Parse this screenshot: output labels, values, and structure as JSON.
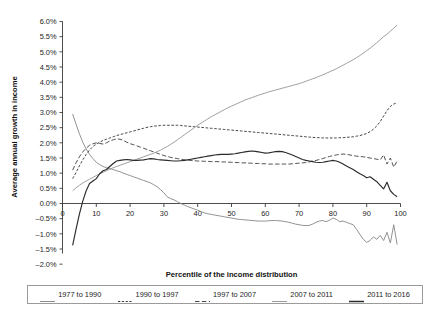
{
  "chart_data": {
    "type": "line",
    "title": "",
    "xlabel": "Percentile of the income distribution",
    "ylabel": "Average annual growth in income",
    "xlim": [
      0,
      100
    ],
    "ylim": [
      -2.0,
      6.0
    ],
    "ytick_labels": [
      "6.0%",
      "5.5%",
      "5.0%",
      "4.5%",
      "4.0%",
      "3.5%",
      "3.0%",
      "2.5%",
      "2.0%",
      "1.5%",
      "1.0%",
      "0.5%",
      "0.0%",
      "-0.5%",
      "-1.0%",
      "-1.5%",
      "-2.0%"
    ],
    "ytick_values": [
      6.0,
      5.5,
      5.0,
      4.5,
      4.0,
      3.5,
      3.0,
      2.5,
      2.0,
      1.5,
      1.0,
      0.5,
      0.0,
      -0.5,
      -1.0,
      -1.5,
      -2.0
    ],
    "xtick_labels": [
      "0",
      "10",
      "20",
      "30",
      "40",
      "50",
      "60",
      "70",
      "80",
      "90",
      "100"
    ],
    "xtick_values": [
      0,
      10,
      20,
      30,
      40,
      50,
      60,
      70,
      80,
      90,
      100
    ],
    "grid": false,
    "legend_position": "bottom",
    "x": [
      3,
      4,
      5,
      6,
      7,
      8,
      9,
      10,
      11,
      12,
      13,
      14,
      15,
      16,
      17,
      18,
      19,
      20,
      21,
      22,
      23,
      24,
      25,
      26,
      27,
      28,
      29,
      30,
      31,
      32,
      33,
      34,
      35,
      36,
      37,
      38,
      39,
      40,
      41,
      42,
      43,
      44,
      45,
      46,
      47,
      48,
      49,
      50,
      51,
      52,
      53,
      54,
      55,
      56,
      57,
      58,
      59,
      60,
      61,
      62,
      63,
      64,
      65,
      66,
      67,
      68,
      69,
      70,
      71,
      72,
      73,
      74,
      75,
      76,
      77,
      78,
      79,
      80,
      81,
      82,
      83,
      84,
      85,
      86,
      87,
      88,
      89,
      90,
      91,
      92,
      93,
      94,
      95,
      96,
      97,
      98,
      99
    ],
    "series": [
      {
        "name": "1977 to 1990",
        "style": "solid",
        "color": "#8c8c8c",
        "values": [
          2.95,
          2.62,
          2.3,
          2.02,
          1.8,
          1.62,
          1.48,
          1.36,
          1.28,
          1.22,
          1.18,
          1.15,
          1.12,
          1.08,
          1.05,
          1.0,
          0.96,
          0.92,
          0.88,
          0.84,
          0.8,
          0.76,
          0.72,
          0.68,
          0.62,
          0.55,
          0.46,
          0.35,
          0.22,
          0.16,
          0.12,
          0.06,
          0.0,
          -0.05,
          -0.1,
          -0.14,
          -0.18,
          -0.22,
          -0.27,
          -0.31,
          -0.34,
          -0.36,
          -0.38,
          -0.4,
          -0.42,
          -0.44,
          -0.46,
          -0.48,
          -0.5,
          -0.52,
          -0.53,
          -0.54,
          -0.55,
          -0.56,
          -0.57,
          -0.58,
          -0.58,
          -0.58,
          -0.57,
          -0.56,
          -0.56,
          -0.57,
          -0.58,
          -0.6,
          -0.62,
          -0.65,
          -0.68,
          -0.7,
          -0.72,
          -0.73,
          -0.72,
          -0.68,
          -0.62,
          -0.58,
          -0.56,
          -0.6,
          -0.55,
          -0.48,
          -0.52,
          -0.6,
          -0.58,
          -0.62,
          -0.66,
          -0.7,
          -0.85,
          -1.02,
          -1.18,
          -1.28,
          -1.22,
          -1.1,
          -1.18,
          -1.05,
          -1.22,
          -0.95,
          -1.3,
          -0.7,
          -1.35
        ]
      },
      {
        "name": "1990 to 1997",
        "style": "dashed-fine",
        "color": "#3d3d3d",
        "values": [
          0.82,
          1.02,
          1.24,
          1.44,
          1.62,
          1.76,
          1.88,
          1.96,
          2.02,
          2.08,
          2.12,
          2.16,
          2.2,
          2.24,
          2.27,
          2.3,
          2.33,
          2.36,
          2.39,
          2.42,
          2.45,
          2.48,
          2.51,
          2.53,
          2.55,
          2.56,
          2.57,
          2.58,
          2.58,
          2.58,
          2.58,
          2.58,
          2.57,
          2.56,
          2.55,
          2.54,
          2.53,
          2.52,
          2.51,
          2.5,
          2.49,
          2.48,
          2.47,
          2.46,
          2.45,
          2.44,
          2.43,
          2.42,
          2.41,
          2.4,
          2.39,
          2.38,
          2.37,
          2.36,
          2.35,
          2.34,
          2.33,
          2.32,
          2.31,
          2.3,
          2.29,
          2.28,
          2.27,
          2.26,
          2.25,
          2.24,
          2.23,
          2.22,
          2.21,
          2.2,
          2.19,
          2.18,
          2.17,
          2.17,
          2.16,
          2.16,
          2.16,
          2.16,
          2.16,
          2.17,
          2.17,
          2.18,
          2.19,
          2.2,
          2.22,
          2.24,
          2.27,
          2.31,
          2.37,
          2.45,
          2.56,
          2.7,
          2.88,
          3.06,
          3.2,
          3.28,
          3.32
        ]
      },
      {
        "name": "1997 to 2007",
        "style": "dashed-long",
        "color": "#4a4a4a",
        "values": [
          1.1,
          1.34,
          1.54,
          1.7,
          1.82,
          1.92,
          1.97,
          2.0,
          1.98,
          1.96,
          2.0,
          2.06,
          2.1,
          2.13,
          2.12,
          2.08,
          2.02,
          1.97,
          1.94,
          1.9,
          1.86,
          1.82,
          1.78,
          1.74,
          1.7,
          1.66,
          1.62,
          1.58,
          1.55,
          1.52,
          1.5,
          1.48,
          1.46,
          1.44,
          1.43,
          1.42,
          1.41,
          1.4,
          1.4,
          1.39,
          1.39,
          1.38,
          1.38,
          1.38,
          1.37,
          1.37,
          1.36,
          1.36,
          1.35,
          1.35,
          1.34,
          1.34,
          1.33,
          1.33,
          1.32,
          1.32,
          1.31,
          1.31,
          1.3,
          1.3,
          1.3,
          1.3,
          1.3,
          1.3,
          1.3,
          1.31,
          1.32,
          1.33,
          1.34,
          1.35,
          1.37,
          1.4,
          1.42,
          1.45,
          1.48,
          1.52,
          1.55,
          1.58,
          1.6,
          1.62,
          1.63,
          1.62,
          1.6,
          1.58,
          1.56,
          1.55,
          1.54,
          1.52,
          1.5,
          1.48,
          1.46,
          1.44,
          1.6,
          1.3,
          1.5,
          1.2,
          1.4
        ]
      },
      {
        "name": "2007 to 2011",
        "style": "solid",
        "color": "#9a9a9a",
        "values": [
          0.42,
          0.52,
          0.6,
          0.68,
          0.74,
          0.8,
          0.86,
          0.92,
          0.98,
          1.03,
          1.08,
          1.13,
          1.18,
          1.22,
          1.26,
          1.3,
          1.34,
          1.38,
          1.42,
          1.46,
          1.5,
          1.54,
          1.58,
          1.62,
          1.66,
          1.71,
          1.76,
          1.82,
          1.88,
          1.95,
          2.02,
          2.1,
          2.18,
          2.26,
          2.34,
          2.42,
          2.5,
          2.58,
          2.65,
          2.72,
          2.79,
          2.86,
          2.92,
          2.98,
          3.04,
          3.1,
          3.16,
          3.21,
          3.26,
          3.31,
          3.36,
          3.41,
          3.45,
          3.49,
          3.53,
          3.57,
          3.61,
          3.64,
          3.68,
          3.71,
          3.74,
          3.77,
          3.8,
          3.83,
          3.86,
          3.89,
          3.92,
          3.95,
          3.99,
          4.03,
          4.07,
          4.11,
          4.15,
          4.2,
          4.24,
          4.29,
          4.34,
          4.39,
          4.44,
          4.5,
          4.56,
          4.62,
          4.68,
          4.74,
          4.81,
          4.88,
          4.96,
          5.04,
          5.12,
          5.21,
          5.3,
          5.4,
          5.5,
          5.58,
          5.68,
          5.78,
          5.88
        ]
      },
      {
        "name": "2011 to 2016",
        "style": "solid-bold",
        "color": "#2b2b2b",
        "values": [
          -1.38,
          -0.85,
          -0.35,
          0.08,
          0.42,
          0.66,
          0.74,
          0.82,
          0.98,
          1.08,
          1.12,
          1.22,
          1.32,
          1.4,
          1.42,
          1.44,
          1.45,
          1.44,
          1.42,
          1.42,
          1.43,
          1.44,
          1.46,
          1.48,
          1.47,
          1.45,
          1.44,
          1.43,
          1.42,
          1.41,
          1.4,
          1.4,
          1.41,
          1.42,
          1.44,
          1.46,
          1.48,
          1.5,
          1.52,
          1.54,
          1.56,
          1.58,
          1.6,
          1.61,
          1.62,
          1.62,
          1.62,
          1.63,
          1.64,
          1.66,
          1.68,
          1.7,
          1.72,
          1.73,
          1.72,
          1.7,
          1.68,
          1.66,
          1.67,
          1.69,
          1.71,
          1.72,
          1.71,
          1.68,
          1.64,
          1.6,
          1.55,
          1.5,
          1.45,
          1.42,
          1.4,
          1.38,
          1.36,
          1.35,
          1.36,
          1.38,
          1.4,
          1.42,
          1.4,
          1.36,
          1.3,
          1.24,
          1.18,
          1.12,
          1.05,
          0.98,
          0.92,
          0.85,
          0.88,
          0.8,
          0.72,
          0.6,
          0.48,
          0.7,
          0.42,
          0.3,
          0.22
        ]
      }
    ]
  },
  "legend": {
    "items": [
      {
        "label": "1977 to 1990",
        "style": "solid",
        "color": "#8c8c8c"
      },
      {
        "label": "1990 to 1997",
        "style": "dashed-fine",
        "color": "#3d3d3d"
      },
      {
        "label": "1997 to 2007",
        "style": "dashed-long",
        "color": "#4a4a4a"
      },
      {
        "label": "2007 to 2011",
        "style": "solid",
        "color": "#9a9a9a"
      },
      {
        "label": "2011 to 2016",
        "style": "solid-bold",
        "color": "#2b2b2b"
      }
    ]
  },
  "caption": ""
}
